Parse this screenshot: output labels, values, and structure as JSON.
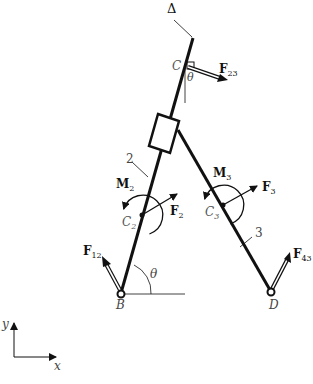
{
  "labels": {
    "delta": "Δ",
    "C": "C",
    "theta_top": "θ",
    "F23": "F",
    "F23_sub": "23",
    "two": "2",
    "M2": "M",
    "M2_sub": "2",
    "F2": "F",
    "F2_sub": "2",
    "C2": "C",
    "C2_sub": "2",
    "M3": "M",
    "M3_sub": "3",
    "F3": "F",
    "F3_sub": "3",
    "C3": "C",
    "C3_sub": "3",
    "three": "3",
    "F12": "F",
    "F12_sub": "12",
    "F43": "F",
    "F43_sub": "43",
    "theta_bottom": "θ",
    "B": "B",
    "D": "D",
    "axis_y": "y",
    "axis_x": "x"
  },
  "colors": {
    "ink": "#111111"
  }
}
